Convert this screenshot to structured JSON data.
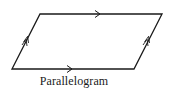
{
  "diagram": {
    "caption": "Parallelogram",
    "stroke_color": "#1a1a1a",
    "vertices": {
      "top_left": [
        40,
        14
      ],
      "top_right": [
        162,
        14
      ],
      "bottom_right": [
        134,
        69
      ],
      "bottom_left": [
        12,
        69
      ]
    },
    "markers": {
      "top_side": "single-arrow-right",
      "bottom_side": "single-arrow-right",
      "left_side": "double-arrow-up",
      "right_side": "double-arrow-up"
    }
  }
}
